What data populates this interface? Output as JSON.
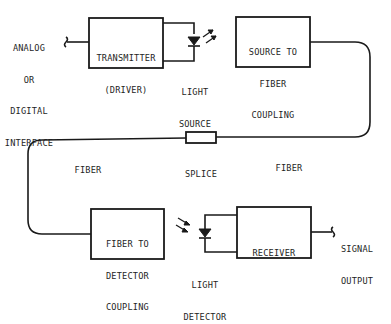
{
  "diagram": {
    "type": "fiber-optic communication link block diagram",
    "input": {
      "lines": [
        "ANALOG",
        "OR",
        "DIGITAL",
        "INTERFACE"
      ]
    },
    "transmitter": {
      "lines": [
        "TRANSMITTER",
        "(DRIVER)"
      ]
    },
    "light_source": {
      "lines": [
        "LIGHT",
        "SOURCE"
      ]
    },
    "source_coupling": {
      "lines": [
        "SOURCE TO",
        "FIBER",
        "COUPLING"
      ]
    },
    "fiber_right": {
      "label": "FIBER"
    },
    "splice": {
      "label": "SPLICE"
    },
    "fiber_left": {
      "label": "FIBER"
    },
    "detector_coupling": {
      "lines": [
        "FIBER TO",
        "DETECTOR",
        "COUPLING"
      ]
    },
    "light_detector": {
      "lines": [
        "LIGHT",
        "DETECTOR"
      ]
    },
    "receiver": {
      "lines": [
        "RECEIVER"
      ]
    },
    "output": {
      "lines": [
        "SIGNAL",
        "OUTPUT"
      ]
    },
    "colors": {
      "line": "#1a1a1a",
      "background": "#ffffff"
    }
  }
}
